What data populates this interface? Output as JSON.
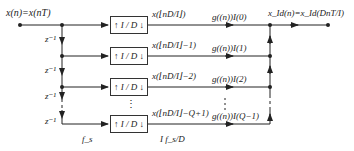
{
  "diagram": {
    "input_label": "x(n)=x(nT)",
    "output_label": "x_Id(n)=x_Id(DnT/I)",
    "delay_label": "z⁻¹",
    "rate_in_label": "f_s",
    "rate_out_label": "I f_s/D",
    "box_label": "↑ I / D ↓",
    "vertical_ellipsis": "⋮",
    "branches": [
      {
        "signal": "x(⌊nD/I⌋)",
        "coef": "g((n))I(0)"
      },
      {
        "signal": "x(⌊nD/I⌋−1)",
        "coef": "g((n))I(1)"
      },
      {
        "signal": "x(⌊nD/I⌋−2)",
        "coef": "g((n))I(2)"
      },
      {
        "signal": "x(⌊nD/I⌋−Q+1)",
        "coef": "g((n))I(Q−1)"
      }
    ]
  }
}
